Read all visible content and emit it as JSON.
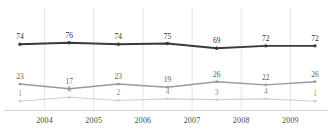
{
  "chart_data": {
    "type": "line",
    "title": "",
    "subtitle": "",
    "xlabel": "",
    "ylabel": "",
    "grid": "vertical-only",
    "legend": "none",
    "show_data_labels": true,
    "categories": [
      "2004",
      "2005",
      "2006",
      "2007",
      "2008",
      "2009",
      ""
    ],
    "tick_labels": [
      "2004",
      "2005",
      "2006",
      "2007",
      "2008",
      "2009"
    ],
    "ylim": [
      0,
      100
    ],
    "xlim": [
      0,
      6
    ],
    "series": [
      {
        "name": "series-1",
        "color": "#3a3a3a",
        "values": [
          74,
          76,
          74,
          75,
          69,
          72,
          72
        ]
      },
      {
        "name": "series-2",
        "color": "#9a9a9a",
        "values": [
          23,
          17,
          23,
          19,
          26,
          22,
          26
        ]
      },
      {
        "name": "series-3",
        "color": "#cfcfcf",
        "values": [
          1,
          6,
          2,
          4,
          3,
          4,
          1
        ]
      }
    ]
  },
  "style": {
    "background": "#ffffff",
    "gridline_color": "#d8d8d8",
    "baseline_color": "#c8c8c8",
    "label_color_s0": "#2f2f2f",
    "label_color_s1": "#5d5d5d",
    "label_color_s2": "#8d8d8d"
  }
}
